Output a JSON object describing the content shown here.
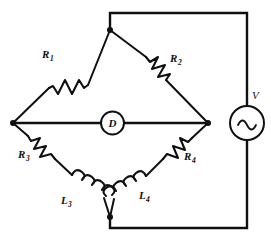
{
  "diagram": {
    "type": "schematic",
    "background_color": "#ffffff",
    "line_color": "#101010",
    "canvas": {
      "width": 271,
      "height": 241
    }
  },
  "components": {
    "r1": {
      "label": "R",
      "subscript": "1",
      "full_label": "R1",
      "kind": "resistor",
      "branch": "top-left"
    },
    "r2": {
      "label": "R",
      "subscript": "2",
      "full_label": "R2",
      "kind": "resistor",
      "branch": "top-right"
    },
    "r3": {
      "label": "R",
      "subscript": "3",
      "full_label": "R3",
      "kind": "resistor",
      "branch": "bottom-left"
    },
    "r4": {
      "label": "R",
      "subscript": "4",
      "full_label": "R4",
      "kind": "resistor",
      "branch": "bottom-right"
    },
    "l3": {
      "label": "L",
      "subscript": "3",
      "full_label": "L3",
      "kind": "inductor",
      "branch": "bottom-left"
    },
    "l4": {
      "label": "L",
      "subscript": "4",
      "full_label": "L4",
      "kind": "inductor",
      "branch": "bottom-right"
    },
    "detector": {
      "label": "D",
      "full_label": "D",
      "kind": "detector",
      "branch": "bridge-middle"
    },
    "source": {
      "label": "V",
      "full_label": "V",
      "kind": "ac-voltage-source",
      "symbol": "sine",
      "branch": "right-rail"
    }
  },
  "nodes": {
    "top": {
      "x": 110,
      "y": 30
    },
    "left": {
      "x": 13,
      "y": 123
    },
    "right": {
      "x": 208,
      "y": 123
    },
    "bottom": {
      "x": 110,
      "y": 217
    }
  }
}
